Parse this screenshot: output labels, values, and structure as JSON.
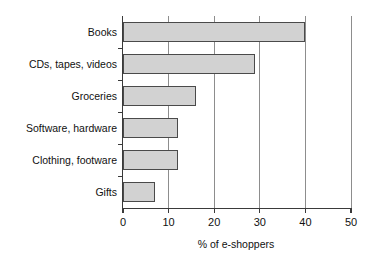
{
  "chart_data": {
    "type": "bar",
    "orientation": "horizontal",
    "title": "",
    "subtitle": "",
    "xlabel": "% of e-shoppers",
    "ylabel": "",
    "categories": [
      "Books",
      "CDs, tapes, videos",
      "Groceries",
      "Software, hardware",
      "Clothing, footware",
      "Gifts"
    ],
    "values": [
      40,
      29,
      16,
      12,
      12,
      7
    ],
    "xlim": [
      0,
      50
    ],
    "xticks": [
      0,
      10,
      20,
      30,
      40,
      50
    ],
    "xtick_labels": [
      "0",
      "10",
      "20",
      "30",
      "40",
      "50"
    ],
    "grid": true,
    "grid_axis": "x",
    "legend": false,
    "legend_position": "none",
    "bar_fill_color": "#d2d2d2",
    "bar_border_color": "#4a4a4a",
    "axis_color": "#3a3a3a",
    "gridline_color": "#8d8d8d",
    "background_color": "#ffffff"
  }
}
